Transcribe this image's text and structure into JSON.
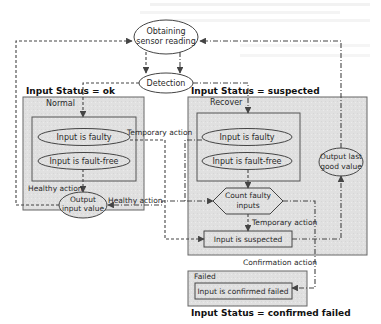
{
  "diagram": {
    "colors": {
      "box_fill": "#e2e2e2",
      "stroke": "#555555",
      "text": "#2a2a2a"
    },
    "nodes": {
      "obtaining": {
        "line1": "Obtaining",
        "line2": "sensor reading"
      },
      "detection": "Detection",
      "output_input_value": {
        "line1": "Output",
        "line2": "input value"
      },
      "output_last_good": {
        "line1": "Output last",
        "line2": "good value"
      },
      "count_faulty": {
        "line1": "Count faulty",
        "line2": "inputs"
      },
      "input_suspected": "Input is suspected",
      "input_confirmed_failed": "Input is confirmed failed"
    },
    "states": {
      "ok": {
        "status_label": "Input Status = ok",
        "state_name": "Normal",
        "faulty": "Input is faulty",
        "fault_free": "Input is fault-free"
      },
      "suspected": {
        "status_label": "Input Status = suspected",
        "state_name": "Recover",
        "faulty": "Input is faulty",
        "fault_free": "Input is fault-free"
      },
      "failed": {
        "status_label": "Input Status = confirmed failed",
        "state_name": "Failed"
      }
    },
    "edge_labels": {
      "temporary_action_1": "Temporary action",
      "healthy_action_1": "Healthy action",
      "healthy_action_2": "Healthy action",
      "temporary_action_2": "Temporary action",
      "confirmation_action": "Confirmation action"
    }
  }
}
